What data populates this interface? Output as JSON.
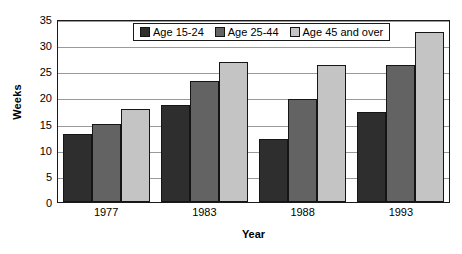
{
  "chart_data": {
    "type": "bar",
    "title": "",
    "xlabel": "Year",
    "ylabel": "Weeks",
    "categories": [
      "1977",
      "1983",
      "1988",
      "1993"
    ],
    "series": [
      {
        "name": "Age 15-24",
        "color": "#2e2e2e",
        "values": [
          13.0,
          18.5,
          12.1,
          17.2
        ]
      },
      {
        "name": "Age 25-44",
        "color": "#636363",
        "values": [
          14.9,
          23.2,
          19.7,
          26.3
        ]
      },
      {
        "name": "Age 45 and over",
        "color": "#c4c4c4",
        "values": [
          17.8,
          26.7,
          26.2,
          32.5
        ]
      }
    ],
    "ylim": [
      0,
      35
    ],
    "yticks": [
      0,
      5,
      10,
      15,
      20,
      25,
      30,
      35
    ],
    "grid": true,
    "legend_position": "top-center"
  }
}
